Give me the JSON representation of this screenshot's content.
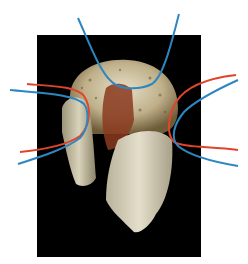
{
  "image": {
    "description": "3D volume-rendered CT of a bone fragment on black background with overlaid annotation curves",
    "background": "#ffffff",
    "scan_background": "#000000"
  },
  "colors": {
    "annotation_blue": "#2e86c1",
    "annotation_red": "#e0452b",
    "bone_light": "#d8d2b8",
    "bone_dark": "#7a6a45",
    "marrow": "#8a3a1e"
  },
  "annotations": [
    {
      "name": "top-blue-curve",
      "color": "blue"
    },
    {
      "name": "left-red-curve",
      "color": "red"
    },
    {
      "name": "left-blue-curve",
      "color": "blue"
    },
    {
      "name": "right-red-curve",
      "color": "red"
    },
    {
      "name": "right-blue-curve",
      "color": "blue"
    }
  ]
}
